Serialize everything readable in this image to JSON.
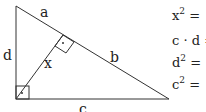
{
  "diagram": {
    "type": "right-triangle-with-altitude",
    "labels": {
      "a": "a",
      "b": "b",
      "c": "c",
      "d": "d",
      "x": "x"
    },
    "right_angle_marker": "·"
  },
  "equations": [
    {
      "base": "x",
      "sup": "2",
      "rest": " ="
    },
    {
      "base": "c · d",
      "sup": "",
      "rest": " ="
    },
    {
      "base": "d",
      "sup": "2",
      "rest": " ="
    },
    {
      "base": "c",
      "sup": "2",
      "rest": " ="
    }
  ]
}
